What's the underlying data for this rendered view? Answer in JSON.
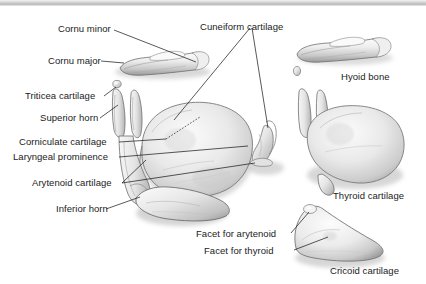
{
  "figure": {
    "background_color": "#ffffff",
    "label_color": "#1b1b1b",
    "leader_color": "#111111",
    "topbar_color": "#c9c9c9",
    "bone_light": "#f2f2f2",
    "bone_mid": "#d0d0d0",
    "bone_shadow": "#8e8e8e"
  },
  "labels": {
    "cornu_minor": "Cornu minor",
    "cornu_major": "Cornu major",
    "triticea_cartilage": "Triticea cartilage",
    "superior_horn": "Superior horn",
    "corniculate_cartilage": "Corniculate cartilage",
    "laryngeal_prominence": "Laryngeal prominence",
    "arytenoid_cartilage": "Arytenoid cartilage",
    "inferior_horn": "Inferior horn",
    "cuneiform_cartilage": "Cuneiform cartilage",
    "hyoid_bone": "Hyoid bone",
    "thyroid_cartilage": "Thyroid cartilage",
    "facet_for_arytenoid": "Facet for arytenoid",
    "facet_for_thyroid": "Facet for thyroid",
    "cricoid_cartilage": "Cricoid cartilage"
  },
  "structures": [
    {
      "name": "hyoid-bone-assembled",
      "label_ref": "cornu_major"
    },
    {
      "name": "triticea-cartilage-nodule",
      "label_ref": "triticea_cartilage"
    },
    {
      "name": "superior-horn-left",
      "label_ref": "superior_horn"
    },
    {
      "name": "thyroid-cartilage-assembled",
      "label_ref": "laryngeal_prominence"
    },
    {
      "name": "inferior-horn-left",
      "label_ref": "inferior_horn"
    },
    {
      "name": "arytenoid-cartilage-isolated",
      "label_ref": "arytenoid_cartilage"
    },
    {
      "name": "hyoid-bone-isolated",
      "label_ref": "hyoid_bone"
    },
    {
      "name": "thyroid-cartilage-isolated",
      "label_ref": "thyroid_cartilage"
    },
    {
      "name": "cricoid-cartilage-isolated",
      "label_ref": "cricoid_cartilage"
    }
  ]
}
